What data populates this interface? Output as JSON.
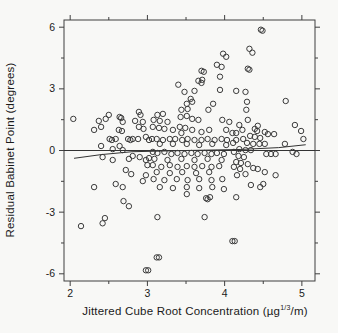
{
  "colors": {
    "background": "#f8f8f6",
    "frame": "#3f3f3f",
    "marker": "#3a3a3a",
    "line": "#333333",
    "text": "#1a1a1a"
  },
  "chart_data": {
    "type": "scatter",
    "title": "",
    "xlabel_prefix": "Jittered Cube Root Concentration (µg",
    "xlabel_sup": "1/3",
    "xlabel_suffix": "/m)",
    "ylabel": "Residual Babinet Point (degrees)",
    "xlim": [
      1.92,
      5.17
    ],
    "ylim": [
      -6.35,
      6.35
    ],
    "x_major_ticks": [
      2,
      3,
      4,
      5
    ],
    "x_major_labels": [
      "2",
      "3",
      "4",
      "5"
    ],
    "x_minor_ticks": [
      2.5,
      3.5,
      4.5
    ],
    "y_major_ticks": [
      -6,
      -3,
      0,
      3,
      6
    ],
    "y_major_labels": [
      "-6",
      "-3",
      "0",
      "3",
      "6"
    ],
    "y_minor_ticks": [
      -4.5,
      -1.5,
      1.5,
      4.5
    ],
    "grid": false,
    "legend": null,
    "marker": "open-circle",
    "reference_line_y": 0,
    "fit_line": [
      [
        2.05,
        -0.38
      ],
      [
        2.4,
        -0.2
      ],
      [
        2.8,
        -0.06
      ],
      [
        3.5,
        0.0
      ],
      [
        4.2,
        0.05
      ],
      [
        4.7,
        0.14
      ],
      [
        5.05,
        0.28
      ]
    ],
    "points": [
      [
        3.98,
        4.71
      ],
      [
        4.02,
        4.56
      ],
      [
        3.9,
        4.17
      ],
      [
        3.96,
        4.07
      ],
      [
        3.7,
        3.88
      ],
      [
        3.73,
        3.83
      ],
      [
        3.94,
        3.59
      ],
      [
        3.66,
        3.39
      ],
      [
        3.71,
        3.44
      ],
      [
        3.7,
        3.29
      ],
      [
        3.4,
        3.2
      ],
      [
        3.94,
        2.95
      ],
      [
        3.48,
        2.85
      ],
      [
        3.61,
        2.9
      ],
      [
        3.56,
        2.51
      ],
      [
        3.58,
        2.37
      ],
      [
        3.51,
        2.27
      ],
      [
        3.85,
        2.27
      ],
      [
        4.47,
        5.88
      ],
      [
        4.49,
        5.83
      ],
      [
        4.32,
        4.95
      ],
      [
        4.36,
        4.76
      ],
      [
        4.3,
        3.98
      ],
      [
        4.32,
        3.93
      ],
      [
        4.15,
        2.9
      ],
      [
        4.27,
        2.85
      ],
      [
        4.29,
        2.37
      ],
      [
        4.79,
        2.41
      ],
      [
        2.04,
        1.54
      ],
      [
        2.37,
        1.44
      ],
      [
        2.46,
        1.54
      ],
      [
        2.5,
        1.73
      ],
      [
        2.31,
        1.0
      ],
      [
        2.4,
        1.15
      ],
      [
        2.64,
        1.63
      ],
      [
        2.66,
        1.58
      ],
      [
        2.68,
        1.39
      ],
      [
        2.63,
        1.0
      ],
      [
        2.67,
        0.95
      ],
      [
        2.89,
        1.88
      ],
      [
        2.91,
        1.73
      ],
      [
        2.84,
        1.44
      ],
      [
        2.94,
        1.39
      ],
      [
        2.89,
        1.15
      ],
      [
        2.95,
        1.05
      ],
      [
        2.51,
        0.56
      ],
      [
        2.54,
        0.51
      ],
      [
        2.59,
        0.56
      ],
      [
        2.75,
        0.56
      ],
      [
        2.78,
        0.51
      ],
      [
        2.81,
        0.56
      ],
      [
        2.88,
        0.56
      ],
      [
        2.98,
        0.66
      ],
      [
        3.02,
        0.51
      ],
      [
        2.4,
        0.22
      ],
      [
        2.55,
        0.07
      ],
      [
        2.64,
        0.22
      ],
      [
        2.68,
        0.02
      ],
      [
        2.42,
        -0.32
      ],
      [
        2.55,
        -0.46
      ],
      [
        2.76,
        -0.41
      ],
      [
        2.81,
        -0.27
      ],
      [
        2.9,
        -0.32
      ],
      [
        2.98,
        -0.46
      ],
      [
        3.02,
        -0.37
      ],
      [
        3.0,
        -0.71
      ],
      [
        2.72,
        -0.95
      ],
      [
        2.79,
        -1.15
      ],
      [
        2.98,
        -1.2
      ],
      [
        2.59,
        -1.63
      ],
      [
        2.68,
        -1.78
      ],
      [
        2.31,
        -1.78
      ],
      [
        2.94,
        -1.49
      ],
      [
        3.44,
        1.98
      ],
      [
        3.52,
        2.02
      ],
      [
        3.79,
        1.98
      ],
      [
        3.13,
        1.73
      ],
      [
        3.2,
        1.78
      ],
      [
        3.08,
        1.49
      ],
      [
        3.16,
        1.44
      ],
      [
        3.26,
        1.39
      ],
      [
        3.43,
        1.63
      ],
      [
        3.51,
        1.68
      ],
      [
        3.58,
        1.54
      ],
      [
        3.66,
        1.49
      ],
      [
        3.97,
        1.49
      ],
      [
        4.06,
        1.39
      ],
      [
        3.07,
        1.15
      ],
      [
        3.15,
        1.1
      ],
      [
        3.22,
        1.05
      ],
      [
        3.33,
        1.0
      ],
      [
        3.42,
        1.15
      ],
      [
        3.49,
        1.1
      ],
      [
        3.44,
        0.85
      ],
      [
        3.58,
        1.0
      ],
      [
        3.7,
        0.9
      ],
      [
        3.8,
        1.0
      ],
      [
        4.02,
        1.0
      ],
      [
        4.1,
        0.85
      ],
      [
        3.06,
        0.56
      ],
      [
        3.12,
        0.56
      ],
      [
        3.2,
        0.51
      ],
      [
        3.29,
        0.56
      ],
      [
        3.36,
        0.56
      ],
      [
        3.45,
        0.51
      ],
      [
        3.52,
        0.56
      ],
      [
        3.61,
        0.51
      ],
      [
        3.7,
        0.51
      ],
      [
        3.78,
        0.56
      ],
      [
        3.87,
        0.51
      ],
      [
        3.96,
        0.56
      ],
      [
        4.03,
        0.51
      ],
      [
        3.16,
        0.32
      ],
      [
        3.33,
        0.32
      ],
      [
        3.51,
        0.32
      ],
      [
        3.67,
        0.27
      ],
      [
        3.84,
        0.32
      ],
      [
        4.02,
        0.27
      ],
      [
        3.07,
        -0.07
      ],
      [
        3.13,
        -0.12
      ],
      [
        3.22,
        -0.07
      ],
      [
        3.31,
        -0.17
      ],
      [
        3.39,
        -0.12
      ],
      [
        3.48,
        -0.17
      ],
      [
        3.57,
        -0.12
      ],
      [
        3.65,
        -0.17
      ],
      [
        3.74,
        -0.12
      ],
      [
        3.83,
        -0.17
      ],
      [
        3.9,
        -0.12
      ],
      [
        3.99,
        -0.17
      ],
      [
        3.09,
        -0.41
      ],
      [
        3.26,
        -0.46
      ],
      [
        3.44,
        -0.41
      ],
      [
        3.61,
        -0.46
      ],
      [
        3.78,
        -0.41
      ],
      [
        3.96,
        -0.46
      ],
      [
        3.07,
        -0.71
      ],
      [
        3.18,
        -0.8
      ],
      [
        3.29,
        -0.71
      ],
      [
        3.39,
        -0.8
      ],
      [
        3.51,
        -0.76
      ],
      [
        3.61,
        -0.8
      ],
      [
        3.71,
        -0.76
      ],
      [
        3.83,
        -0.8
      ],
      [
        3.93,
        -0.76
      ],
      [
        3.12,
        -1.05
      ],
      [
        3.29,
        -1.1
      ],
      [
        3.45,
        -1.05
      ],
      [
        3.63,
        -1.1
      ],
      [
        3.8,
        -1.05
      ],
      [
        3.08,
        -1.39
      ],
      [
        3.22,
        -1.44
      ],
      [
        3.38,
        -1.39
      ],
      [
        3.52,
        -1.44
      ],
      [
        3.67,
        -1.39
      ],
      [
        3.83,
        -1.44
      ],
      [
        3.97,
        -1.39
      ],
      [
        3.16,
        -1.78
      ],
      [
        3.33,
        -1.83
      ],
      [
        3.51,
        -1.78
      ],
      [
        3.67,
        -1.83
      ],
      [
        3.84,
        -1.78
      ],
      [
        3.99,
        -1.88
      ],
      [
        4.28,
        1.98
      ],
      [
        4.3,
        1.49
      ],
      [
        4.19,
        1.24
      ],
      [
        4.23,
        1.0
      ],
      [
        4.15,
        0.85
      ],
      [
        4.39,
        1.05
      ],
      [
        4.42,
        0.95
      ],
      [
        4.43,
        1.2
      ],
      [
        4.52,
        0.9
      ],
      [
        4.56,
        0.8
      ],
      [
        4.64,
        0.8
      ],
      [
        4.91,
        1.24
      ],
      [
        4.99,
        0.95
      ],
      [
        5.02,
        0.56
      ],
      [
        4.78,
        0.32
      ],
      [
        4.33,
        0.71
      ],
      [
        4.39,
        0.66
      ],
      [
        4.46,
        0.61
      ],
      [
        4.24,
        0.56
      ],
      [
        4.15,
        0.51
      ],
      [
        4.11,
        0.37
      ],
      [
        4.29,
        0.37
      ],
      [
        4.37,
        0.32
      ],
      [
        4.45,
        0.32
      ],
      [
        4.52,
        0.32
      ],
      [
        4.19,
        0.07
      ],
      [
        4.27,
        0.02
      ],
      [
        4.34,
        0.02
      ],
      [
        4.12,
        -0.07
      ],
      [
        4.18,
        -0.27
      ],
      [
        4.25,
        -0.32
      ],
      [
        4.54,
        -0.17
      ],
      [
        4.6,
        -0.17
      ],
      [
        4.66,
        -0.17
      ],
      [
        4.88,
        -0.07
      ],
      [
        4.93,
        -0.17
      ],
      [
        4.15,
        -0.56
      ],
      [
        4.21,
        -0.61
      ],
      [
        4.3,
        -0.66
      ],
      [
        4.12,
        -0.8
      ],
      [
        4.2,
        -0.9
      ],
      [
        4.37,
        -0.85
      ],
      [
        4.43,
        -0.9
      ],
      [
        4.27,
        -1.15
      ],
      [
        4.16,
        -1.2
      ],
      [
        4.52,
        -1.05
      ],
      [
        4.66,
        -1.2
      ],
      [
        4.34,
        -1.68
      ],
      [
        4.46,
        -1.78
      ],
      [
        4.5,
        -1.63
      ],
      [
        2.69,
        -2.46
      ],
      [
        2.76,
        -2.71
      ],
      [
        2.45,
        -3.29
      ],
      [
        2.42,
        -3.54
      ],
      [
        2.14,
        -3.68
      ],
      [
        2.98,
        -5.83
      ],
      [
        3.01,
        -5.83
      ],
      [
        3.51,
        -2.12
      ],
      [
        3.78,
        -2.37
      ],
      [
        3.81,
        -2.27
      ],
      [
        3.76,
        -2.32
      ],
      [
        3.13,
        -3.24
      ],
      [
        3.74,
        -3.24
      ],
      [
        3.12,
        -5.2
      ],
      [
        3.15,
        -5.2
      ],
      [
        4.15,
        -2.27
      ],
      [
        4.1,
        -4.41
      ],
      [
        4.13,
        -4.41
      ]
    ]
  }
}
